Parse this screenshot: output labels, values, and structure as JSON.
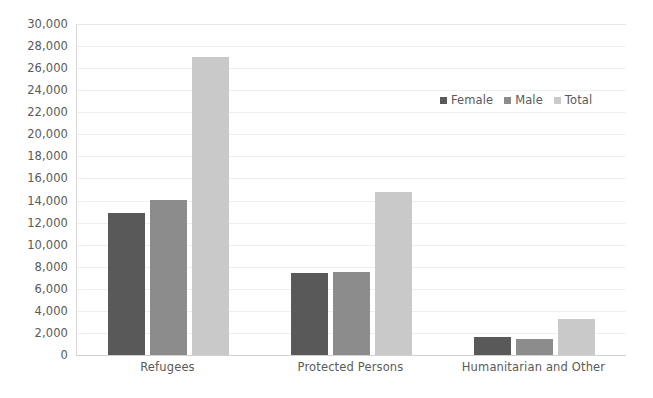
{
  "chart_data": {
    "type": "bar",
    "title": "",
    "subtitle": "",
    "xlabel": "",
    "ylabel": "",
    "categories": [
      "Refugees",
      "Protected Persons",
      "Humanitarian and Other"
    ],
    "series": [
      {
        "name": "Female",
        "color": "#595959",
        "values": [
          12870,
          7450,
          1650
        ]
      },
      {
        "name": "Male",
        "color": "#8c8c8c",
        "values": [
          14050,
          7550,
          1460
        ]
      },
      {
        "name": "Total",
        "color": "#c9c9c9",
        "values": [
          27000,
          14780,
          3250
        ]
      }
    ],
    "ylim": [
      0,
      30000
    ],
    "ytick_step": 2000,
    "ytick_labels": [
      "30,000",
      "28,000",
      "26,000",
      "24,000",
      "22,000",
      "20,000",
      "18,000",
      "16,000",
      "14,000",
      "12,000",
      "10,000",
      "8,000",
      "6,000",
      "4,000",
      "2,000",
      "0"
    ],
    "ytick_values": [
      30000,
      28000,
      26000,
      24000,
      22000,
      20000,
      18000,
      16000,
      14000,
      12000,
      10000,
      8000,
      6000,
      4000,
      2000,
      0
    ],
    "grid": true,
    "grid_axis": "y",
    "legend": true,
    "legend_position": "inside-upper-right",
    "legend_entries": [
      "Female",
      "Male",
      "Total"
    ],
    "bar_group_count": 3,
    "bars_per_group": 3,
    "annotations": [],
    "background_color": "#ffffff",
    "axis_color": "#d9d9d9",
    "gridline_color": "#efefef",
    "tick_text_color": "#5a5a5a"
  }
}
